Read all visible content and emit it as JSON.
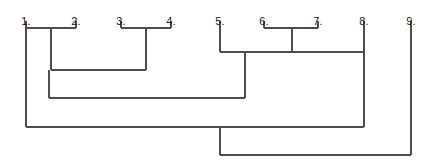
{
  "figure": {
    "kind": "dendrogram",
    "background_color": "#ffffff",
    "line_color": "#4d4d4d",
    "label_color": "#1a1a1a",
    "line_width": 1.2,
    "width": 440,
    "height": 165
  },
  "leaves": [
    {
      "label": "1.",
      "x": 26,
      "tick_top": 21,
      "tick_bottom": 28
    },
    {
      "label": "2.",
      "x": 76,
      "tick_top": 21,
      "tick_bottom": 28
    },
    {
      "label": "3.",
      "x": 121,
      "tick_top": 21,
      "tick_bottom": 28
    },
    {
      "label": "4.",
      "x": 171,
      "tick_top": 21,
      "tick_bottom": 28
    },
    {
      "label": "5.",
      "x": 220,
      "tick_top": 21,
      "tick_bottom": 28
    },
    {
      "label": "6.",
      "x": 264,
      "tick_top": 21,
      "tick_bottom": 28
    },
    {
      "label": "7.",
      "x": 318,
      "tick_top": 21,
      "tick_bottom": 28
    },
    {
      "label": "8.",
      "x": 364,
      "tick_top": 21,
      "tick_bottom": 28
    },
    {
      "label": "9.",
      "x": 411,
      "tick_top": 21,
      "tick_bottom": 28
    }
  ],
  "label_row_y": 16,
  "chart_data": {
    "type": "dendrogram",
    "title": "",
    "xlabel": "",
    "ylabel": "",
    "orientation": "top-down",
    "leaf_labels": [
      "1.",
      "2.",
      "3.",
      "4.",
      "5.",
      "6.",
      "7.",
      "8.",
      "9."
    ],
    "leaf_x": [
      26,
      76,
      121,
      171,
      220,
      264,
      318,
      364,
      411
    ],
    "merges": [
      {
        "id": "m1",
        "members": [
          "1.",
          "2."
        ],
        "left_x": 26,
        "right_x": 76,
        "join_y": 28,
        "stem_x": 51,
        "stem_to_y": 70
      },
      {
        "id": "m2",
        "members": [
          "3.",
          "4."
        ],
        "left_x": 121,
        "right_x": 171,
        "join_y": 28,
        "stem_x": 146,
        "stem_to_y": 70
      },
      {
        "id": "m3",
        "members": [
          "6.",
          "7."
        ],
        "left_x": 264,
        "right_x": 318,
        "join_y": 28,
        "stem_x": 292,
        "stem_to_y": 52
      },
      {
        "id": "m4",
        "members": [
          "5.",
          "(6.,7.)",
          "8."
        ],
        "left_x": 220,
        "right_x": 364,
        "join_y": 52,
        "stem_x": 245,
        "stem_to_y": 98
      },
      {
        "id": "m5",
        "members": [
          "(1.,2.)",
          "(3.,4.)"
        ],
        "left_x": 51,
        "right_x": 146,
        "join_y": 70,
        "stem_x": 49,
        "stem_to_y": 98
      },
      {
        "id": "m6",
        "members": [
          "(1.-4.)",
          "(5.-8.)"
        ],
        "left_x": 49,
        "right_x": 245,
        "join_y": 98,
        "stem_x": 26,
        "stem_to_y": 127
      },
      {
        "id": "m7",
        "members": [
          "(1.-4.)",
          "(5.-8.)"
        ],
        "left_x": 26,
        "right_x": 364,
        "join_y": 127,
        "stem_x": 220,
        "stem_to_y": 155
      },
      {
        "id": "m8",
        "members": [
          "root",
          "9."
        ],
        "left_x": 220,
        "right_x": 411,
        "join_y": 155,
        "stem_x": null,
        "stem_to_y": null
      }
    ],
    "leaf_stems": [
      {
        "leaf": "1.",
        "x": 26,
        "from_y": 28,
        "to_y": 127
      },
      {
        "leaf": "2.",
        "x": 76,
        "from_y": 28,
        "to_y": 28
      },
      {
        "leaf": "3.",
        "x": 121,
        "from_y": 28,
        "to_y": 28
      },
      {
        "leaf": "4.",
        "x": 171,
        "from_y": 28,
        "to_y": 28
      },
      {
        "leaf": "5.",
        "x": 220,
        "from_y": 28,
        "to_y": 52
      },
      {
        "leaf": "6.",
        "x": 264,
        "from_y": 28,
        "to_y": 28
      },
      {
        "leaf": "7.",
        "x": 318,
        "from_y": 28,
        "to_y": 28
      },
      {
        "leaf": "8.",
        "x": 364,
        "from_y": 28,
        "to_y": 127
      },
      {
        "leaf": "9.",
        "x": 411,
        "from_y": 28,
        "to_y": 155
      }
    ],
    "grid": false,
    "legend": null
  }
}
